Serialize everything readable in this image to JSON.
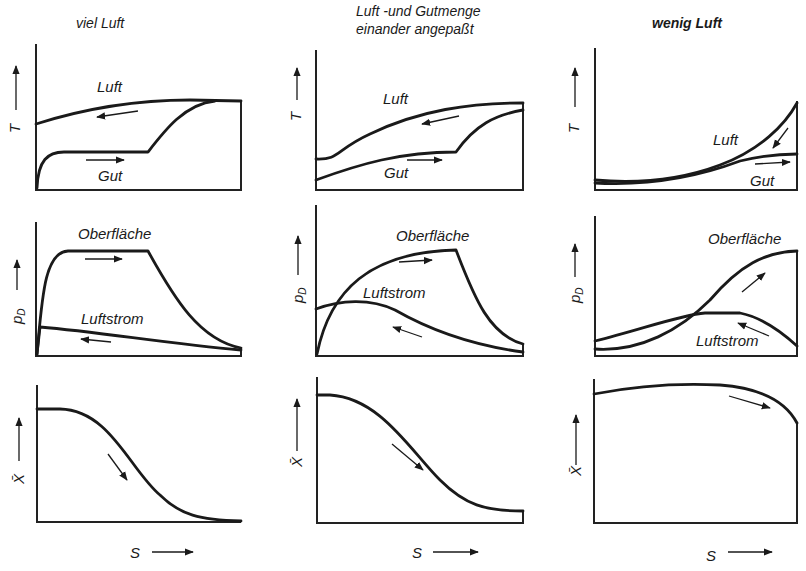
{
  "columns": [
    {
      "title_lines": [
        "viel Luft"
      ]
    },
    {
      "title_lines": [
        "Luft -und Gutmenge",
        "einander angepaßt"
      ]
    },
    {
      "title_lines": [
        "wenig Luft"
      ]
    }
  ],
  "rows": [
    {
      "y_axis_label": "T",
      "curve_labels": [
        "Luft",
        "Gut"
      ]
    },
    {
      "y_axis_label": "p_D",
      "y_axis_main": "p",
      "y_axis_sub": "D",
      "curve_labels": [
        "Oberfläche",
        "Luftstrom"
      ]
    },
    {
      "y_axis_label": "X̄",
      "curve_labels": []
    }
  ],
  "x_axis_label": "S",
  "panels": {
    "r0c0": {
      "labels": {
        "a": "Luft",
        "b": "Gut"
      }
    },
    "r0c1": {
      "labels": {
        "a": "Luft",
        "b": "Gut"
      }
    },
    "r0c2": {
      "labels": {
        "a": "Luft",
        "b": "Gut"
      }
    },
    "r1c0": {
      "labels": {
        "a": "Oberfläche",
        "b": "Luftstrom"
      }
    },
    "r1c1": {
      "labels": {
        "a": "Oberfläche",
        "b": "Luftstrom"
      }
    },
    "r1c2": {
      "labels": {
        "a": "Oberfläche",
        "b": "Luftstrom"
      }
    }
  },
  "colors": {
    "ink": "#1a1a1a",
    "background": "#ffffff"
  }
}
